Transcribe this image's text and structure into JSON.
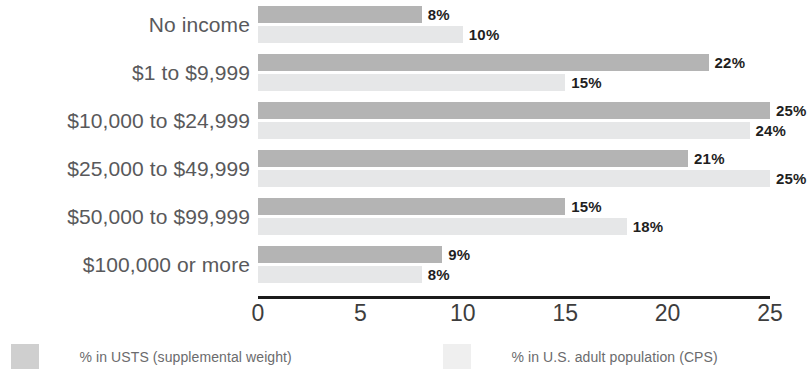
{
  "chart_data": {
    "type": "bar",
    "orientation": "horizontal",
    "title": "",
    "subtitle": "",
    "xlabel": "",
    "ylabel": "",
    "xlim": [
      0,
      25
    ],
    "xticks": [
      0,
      5,
      10,
      15,
      20,
      25
    ],
    "xtick_labels": [
      "0",
      "5",
      "10",
      "15",
      "20",
      "25"
    ],
    "grid": false,
    "legend_position": "bottom",
    "value_suffix": "%",
    "categories": [
      "No income",
      "$1 to $9,999",
      "$10,000 to $24,999",
      "$25,000 to $49,999",
      "$50,000 to $99,999",
      "$100,000 or more"
    ],
    "series": [
      {
        "name": "% in USTS (supplemental weight)",
        "color": "#b4b4b4",
        "legend_swatch_color": "#cfcfcf",
        "values": [
          8,
          22,
          25,
          21,
          15,
          9
        ],
        "labels": [
          "8%",
          "22%",
          "25%",
          "21%",
          "15%",
          "9%"
        ]
      },
      {
        "name": "% in U.S. adult population (CPS)",
        "color": "#e6e7e8",
        "legend_swatch_color": "#efefef",
        "values": [
          10,
          15,
          24,
          25,
          18,
          8
        ],
        "labels": [
          "10%",
          "15%",
          "24%",
          "25%",
          "18%",
          "8%"
        ]
      }
    ]
  },
  "legend": {
    "items": [
      {
        "label": "% in USTS (supplemental weight)"
      },
      {
        "label": "% in U.S. adult population (CPS)"
      }
    ]
  },
  "axis": {
    "tick_labels": [
      "0",
      "5",
      "10",
      "15",
      "20",
      "25"
    ]
  }
}
